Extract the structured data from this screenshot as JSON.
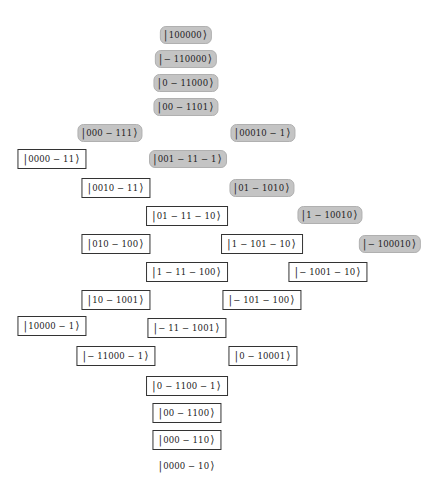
{
  "diagram": {
    "styles": {
      "gray_fill": "#c4c4c4",
      "white_fill": "#ffffff",
      "border": "#333333"
    },
    "ket_open": "|",
    "ket_close": "⟩",
    "nodes": [
      {
        "label": "100000",
        "style": "gray",
        "x": 186,
        "y": 35
      },
      {
        "label": "− 110000",
        "style": "gray",
        "x": 186,
        "y": 59
      },
      {
        "label": "0 − 11000",
        "style": "gray",
        "x": 186,
        "y": 83
      },
      {
        "label": "00 − 1101",
        "style": "gray",
        "x": 186,
        "y": 107
      },
      {
        "label": "000 − 111",
        "style": "gray",
        "x": 110,
        "y": 133
      },
      {
        "label": "00010 − 1",
        "style": "gray",
        "x": 263,
        "y": 133
      },
      {
        "label": "0000 − 11",
        "style": "white",
        "x": 52,
        "y": 159
      },
      {
        "label": "001 − 11 − 1",
        "style": "gray",
        "x": 188,
        "y": 159
      },
      {
        "label": "0010 − 11",
        "style": "white",
        "x": 116,
        "y": 188
      },
      {
        "label": "01 − 1010",
        "style": "gray",
        "x": 262,
        "y": 188
      },
      {
        "label": "01 − 11 − 10",
        "style": "white",
        "x": 187,
        "y": 216
      },
      {
        "label": "1 − 10010",
        "style": "gray",
        "x": 330,
        "y": 215
      },
      {
        "label": "010 − 100",
        "style": "white",
        "x": 116,
        "y": 244
      },
      {
        "label": "1 − 101 − 10",
        "style": "white",
        "x": 262,
        "y": 244
      },
      {
        "label": "− 100010",
        "style": "gray",
        "x": 390,
        "y": 244
      },
      {
        "label": "1 − 11 − 100",
        "style": "white",
        "x": 187,
        "y": 272
      },
      {
        "label": "− 1001 − 10",
        "style": "white",
        "x": 328,
        "y": 272
      },
      {
        "label": "10 − 1001",
        "style": "white",
        "x": 116,
        "y": 300
      },
      {
        "label": "− 101 − 100",
        "style": "white",
        "x": 262,
        "y": 300
      },
      {
        "label": "10000 − 1",
        "style": "white",
        "x": 52,
        "y": 326
      },
      {
        "label": "− 11 − 1001",
        "style": "white",
        "x": 187,
        "y": 328
      },
      {
        "label": "− 11000 − 1",
        "style": "white",
        "x": 116,
        "y": 356
      },
      {
        "label": "0 − 10001",
        "style": "white",
        "x": 263,
        "y": 356
      },
      {
        "label": "0 − 1100 − 1",
        "style": "white",
        "x": 187,
        "y": 386
      },
      {
        "label": "00 − 1100",
        "style": "white",
        "x": 187,
        "y": 413
      },
      {
        "label": "000 − 110",
        "style": "white",
        "x": 187,
        "y": 440
      },
      {
        "label": "0000 − 10",
        "style": "plain",
        "x": 187,
        "y": 466
      }
    ]
  }
}
